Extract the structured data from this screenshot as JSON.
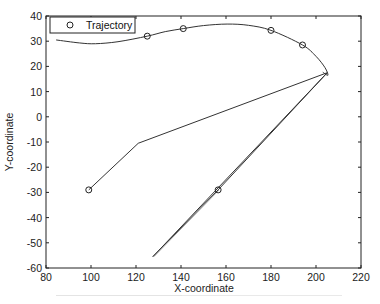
{
  "chart_data": {
    "type": "line",
    "title": "",
    "xlabel": "X-coordinate",
    "ylabel": "Y-coordinate",
    "xlim": [
      80,
      220
    ],
    "ylim": [
      -60,
      40
    ],
    "xticks": [
      80,
      100,
      120,
      140,
      160,
      180,
      200,
      220
    ],
    "yticks": [
      40,
      30,
      20,
      10,
      0,
      -10,
      -20,
      -30,
      -40,
      -50,
      -60
    ],
    "grid": false,
    "legend": {
      "position": "upper-left",
      "entries": [
        {
          "label": "Trajectory",
          "marker": "circle"
        }
      ]
    },
    "series": [
      {
        "name": "Trajectory (curve)",
        "x": [
          84.5,
          95,
          102,
          112,
          125,
          133,
          141,
          150,
          160.5,
          170,
          180,
          194,
          200,
          204,
          205.3,
          203
        ],
        "y": [
          30.5,
          29.3,
          29,
          29.8,
          32,
          33.8,
          35,
          36.2,
          36.8,
          36.3,
          34.3,
          28.5,
          24,
          19.5,
          16.5,
          17.7
        ]
      },
      {
        "name": "Path segments",
        "x": [
          99,
          121,
          205,
          127.5,
          156.5,
          205
        ],
        "y": [
          -29,
          -10.5,
          17.5,
          -55.5,
          -29,
          17.5
        ]
      },
      {
        "name": "Trajectory markers",
        "x": [
          125,
          141,
          180,
          194,
          99,
          156.5
        ],
        "y": [
          32,
          35,
          34.3,
          28.5,
          -29,
          -29
        ]
      }
    ]
  },
  "legend": {
    "label": "Trajectory"
  },
  "axes": {
    "xlabel": "X-coordinate",
    "ylabel": "Y-coordinate"
  },
  "colors": {
    "line": "#333333",
    "axis": "#222222",
    "background": "#ffffff"
  }
}
